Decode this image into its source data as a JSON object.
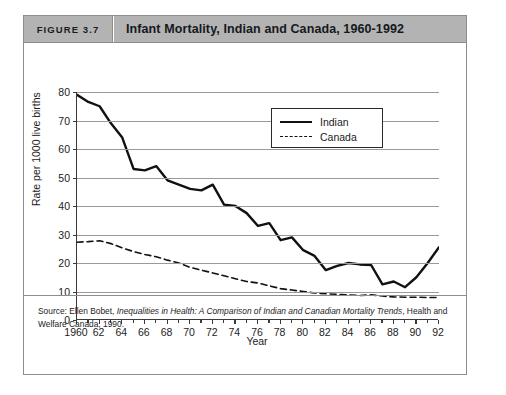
{
  "figure": {
    "number_label": "FIGURE 3.7",
    "title": "Infant Mortality, Indian and Canada, 1960-1992",
    "source_prefix": "Source: Ellen Bobet, ",
    "source_italic": "Inequalities in Health: A Comparison of Indian and Canadian Mortality Trends",
    "source_suffix": ", Health and Welfare Canada, 1990."
  },
  "colors": {
    "header_background": "#b3b3b3",
    "card_border": "#8d8d8d",
    "gridline": "#9a9a9a",
    "axis": "#3a3a3a",
    "series_indian": "#111111",
    "series_canada": "#111111"
  },
  "chart_data": {
    "type": "line",
    "title": "Infant Mortality, Indian and Canada, 1960-1992",
    "xlabel": "Year",
    "ylabel": "Rate per 1000 live births",
    "xlim": [
      1960,
      1992
    ],
    "ylim": [
      0,
      80
    ],
    "grid": true,
    "legend_position": "top-right",
    "y_ticks": [
      0,
      10,
      20,
      30,
      40,
      50,
      60,
      70,
      80
    ],
    "x_ticks": [
      1960,
      1962,
      1964,
      1966,
      1968,
      1970,
      1972,
      1974,
      1976,
      1978,
      1980,
      1982,
      1984,
      1986,
      1988,
      1990,
      1992
    ],
    "x_tick_labels": [
      "1960",
      "62",
      "64",
      "66",
      "68",
      "70",
      "72",
      "74",
      "76",
      "78",
      "80",
      "82",
      "84",
      "86",
      "88",
      "90",
      "92"
    ],
    "x": [
      1960,
      1961,
      1962,
      1963,
      1964,
      1965,
      1966,
      1967,
      1968,
      1969,
      1970,
      1971,
      1972,
      1973,
      1974,
      1975,
      1976,
      1977,
      1978,
      1979,
      1980,
      1981,
      1982,
      1983,
      1984,
      1985,
      1986,
      1987,
      1988,
      1989,
      1990,
      1991,
      1992
    ],
    "series": [
      {
        "name": "Indian",
        "style": "solid",
        "values": [
          79,
          76.5,
          75,
          69,
          64,
          53,
          52.5,
          54,
          49,
          47.5,
          46,
          45.5,
          47.5,
          40.5,
          40,
          37.5,
          33,
          34,
          28,
          29,
          24.5,
          22.5,
          17.5,
          19,
          20,
          19.5,
          19.3,
          12.5,
          13.5,
          11.5,
          15,
          20,
          25.5
        ]
      },
      {
        "name": "Canada",
        "style": "dashed",
        "values": [
          27.3,
          27.5,
          27.8,
          26.8,
          25.3,
          24,
          23,
          22.2,
          21,
          20,
          18.5,
          17.5,
          16.5,
          15.5,
          14.5,
          13.5,
          13,
          12,
          11,
          10.5,
          10,
          9.5,
          9.2,
          9,
          8.8,
          8.6,
          8.8,
          8.4,
          8.1,
          8,
          8,
          7.9,
          7.9
        ]
      }
    ]
  },
  "legend": {
    "items": [
      {
        "label": "Indian",
        "style": "solid"
      },
      {
        "label": "Canada",
        "style": "dashed"
      }
    ]
  }
}
